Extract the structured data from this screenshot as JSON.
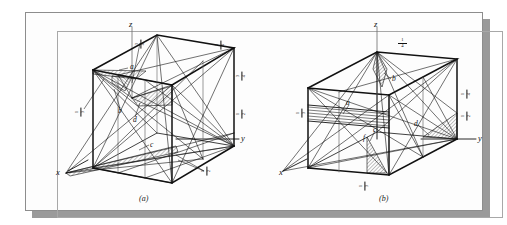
{
  "figure": {
    "kind": "crystallographic-plane-diagram",
    "panels": [
      {
        "id": "a",
        "caption": "(a)",
        "axes": {
          "x": "x",
          "y": "y",
          "z": "z"
        },
        "plane_labels": [
          "a",
          "b",
          "c",
          "d"
        ],
        "intercepts": [
          {
            "id": "a-z-top",
            "numerator": "3",
            "denominator": "4"
          },
          {
            "id": "a-left",
            "numerator": "1",
            "denominator": "3"
          },
          {
            "id": "a-y-far",
            "numerator": "3",
            "denominator": "4"
          },
          {
            "id": "a-right-up",
            "numerator": "3",
            "denominator": "4"
          },
          {
            "id": "a-right-lo",
            "numerator": "1",
            "denominator": "2"
          },
          {
            "id": "a-bottom",
            "numerator": "1",
            "denominator": "2"
          }
        ]
      },
      {
        "id": "b",
        "caption": "(b)",
        "axes": {
          "x": "x",
          "y": "y",
          "z": "z"
        },
        "plane_labels": [
          "a",
          "b",
          "c",
          "d",
          "f"
        ],
        "intercepts": [
          {
            "id": "b-z-top",
            "numerator": "1",
            "denominator": "4"
          },
          {
            "id": "b-left",
            "numerator": "1",
            "denominator": "3"
          },
          {
            "id": "b-right-up",
            "numerator": "1",
            "denominator": "4"
          },
          {
            "id": "b-right-lo",
            "numerator": "1",
            "denominator": "2"
          },
          {
            "id": "b-bottom",
            "numerator": "1",
            "denominator": "3"
          }
        ]
      }
    ],
    "colors": {
      "ink": "#111111",
      "page": "#fdfdfd",
      "plate_border": "#8d8d8d",
      "inner_border": "#a8a8a8",
      "shadow": "#9a9a9a",
      "hatch": "#222222"
    }
  }
}
